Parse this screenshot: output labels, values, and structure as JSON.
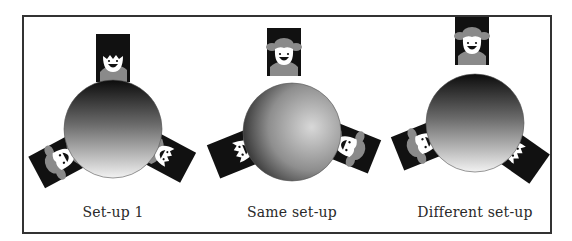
{
  "figure": {
    "panels": [
      {
        "label": "Set-up 1",
        "center_x": 113,
        "circle": {
          "cx": 113,
          "cy": 129,
          "r": 49,
          "gradient": "vertical-dark-top"
        },
        "seats": [
          {
            "position": "top",
            "angle": 0,
            "person": "boy",
            "cx": 113,
            "cy": 58
          },
          {
            "position": "lower-left",
            "angle": -120,
            "person": "girl",
            "cx": 56,
            "cy": 161
          },
          {
            "position": "lower-right",
            "angle": 120,
            "person": "boy",
            "cx": 170,
            "cy": 158
          }
        ]
      },
      {
        "label": "Same set-up",
        "center_x": 292,
        "circle": {
          "cx": 292,
          "cy": 132,
          "r": 49,
          "gradient": "radial-dark-left"
        },
        "seats": [
          {
            "position": "top",
            "angle": 0,
            "person": "girl",
            "cx": 284,
            "cy": 52
          },
          {
            "position": "lower-left",
            "angle": -115,
            "person": "boy",
            "cx": 234,
            "cy": 154
          },
          {
            "position": "lower-right",
            "angle": 115,
            "person": "girl",
            "cx": 353,
            "cy": 148
          }
        ]
      },
      {
        "label": "Different set-up",
        "center_x": 475,
        "circle": {
          "cx": 475,
          "cy": 123,
          "r": 49,
          "gradient": "vertical-dark-top"
        },
        "seats": [
          {
            "position": "top",
            "angle": 0,
            "person": "girl",
            "cx": 472,
            "cy": 41
          },
          {
            "position": "lower-left",
            "angle": -115,
            "person": "girl",
            "cx": 418,
            "cy": 145
          },
          {
            "position": "lower-right",
            "angle": 125,
            "person": "boy",
            "cx": 521,
            "cy": 155
          }
        ]
      }
    ],
    "colors": {
      "frame": "#333333",
      "card": "#111111",
      "figure_gray": "#8a8a8a",
      "face": "#ffffff",
      "text": "#2a2a2a"
    }
  }
}
